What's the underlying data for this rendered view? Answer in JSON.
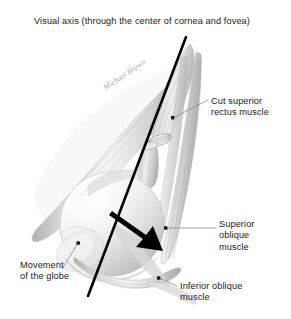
{
  "figure": {
    "kind": "anatomical-illustration",
    "background_color": "#ffffff",
    "width": 291,
    "height": 319
  },
  "title": {
    "text": "Visual axis (through the center of cornea and fovea)"
  },
  "signature": {
    "text": "Michael Brown"
  },
  "labels": [
    {
      "id": "cut-superior-rectus",
      "text": "Cut superior\nrectus muscle",
      "leader_dot": {
        "x": 173,
        "y": 118
      },
      "leader_end": {
        "x": 208,
        "y": 100
      }
    },
    {
      "id": "superior-oblique",
      "text": "Superior\noblique\nmuscle",
      "leader_dot": {
        "x": 166,
        "y": 228
      },
      "leader_end": {
        "x": 216,
        "y": 228
      }
    },
    {
      "id": "inferior-oblique",
      "text": "Inferior oblique\nmuscle",
      "leader_dot": {
        "x": 159,
        "y": 278
      },
      "leader_end": {
        "x": 177,
        "y": 285
      }
    },
    {
      "id": "movement-of-the-globe",
      "text": "Movement\nof the globe",
      "leader_dot": {
        "x": 78,
        "y": 243
      },
      "leader_end": {
        "x": 61,
        "y": 270
      }
    }
  ],
  "visual_axis": {
    "name": "visual-axis-line",
    "color": "#000000",
    "stroke_width": 2.6,
    "start": {
      "x": 186,
      "y": 37
    },
    "end": {
      "x": 88,
      "y": 296
    }
  },
  "movement_arrow": {
    "name": "globe-movement-arrow",
    "color": "#000000",
    "direction": "down-right",
    "start": {
      "x": 112,
      "y": 212
    },
    "end": {
      "x": 161,
      "y": 249
    }
  },
  "colors": {
    "text": "#1c1c1c",
    "line": "#000000",
    "leader": "#8a8a8a",
    "globe_light": "#f2f2f2",
    "globe_mid": "#dcdcdc",
    "globe_shadow": "#bdbdbd",
    "muscle_light": "#e6e6e6",
    "muscle_mid": "#c9c9c9",
    "muscle_dark": "#9c9c9c",
    "signature": "#8d8d8d"
  }
}
